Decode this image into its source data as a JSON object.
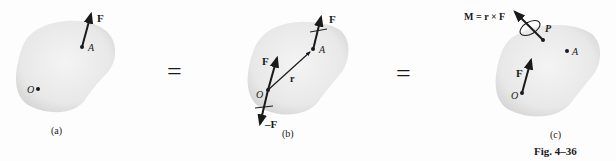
{
  "figure": {
    "caption": "Fig. 4–36",
    "equals_sign": "="
  },
  "panels": [
    {
      "id": "a",
      "sublabel": "(a)",
      "points": {
        "O": "O",
        "A": "A"
      },
      "forces": [
        {
          "label": "F",
          "at": "A"
        }
      ]
    },
    {
      "id": "b",
      "sublabel": "(b)",
      "points": {
        "O": "O",
        "A": "A"
      },
      "position_vector": "r",
      "forces": [
        {
          "label": "F",
          "at": "A"
        },
        {
          "label": "F",
          "at": "O"
        },
        {
          "label": "–F",
          "at": "O"
        }
      ]
    },
    {
      "id": "c",
      "sublabel": "(c)",
      "points": {
        "O": "O",
        "A": "A",
        "P": "P"
      },
      "forces": [
        {
          "label": "F",
          "at": "O"
        }
      ],
      "moment": "M = r × F"
    }
  ],
  "colors": {
    "body_fill": "#e6e6e6",
    "ink": "#1a1a1a"
  }
}
